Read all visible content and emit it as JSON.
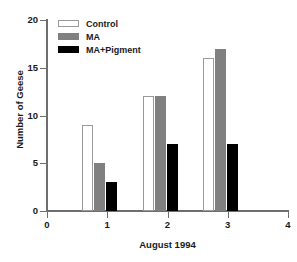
{
  "chart_data": {
    "type": "bar",
    "title": "",
    "xlabel": "August 1994",
    "ylabel": "Number of Geese",
    "categories": [
      "1",
      "2",
      "3"
    ],
    "series": [
      {
        "name": "Control",
        "color": "#ffffff",
        "values": [
          9,
          12,
          16
        ]
      },
      {
        "name": "MA",
        "color": "#808080",
        "values": [
          5,
          12,
          17
        ]
      },
      {
        "name": "MA+Pigment",
        "color": "#000000",
        "values": [
          3,
          7,
          7
        ]
      }
    ],
    "xlim": [
      0,
      4
    ],
    "ylim": [
      0,
      20
    ],
    "xticks": [
      "0",
      "1",
      "2",
      "3",
      "4"
    ],
    "yticks": [
      "0",
      "5",
      "10",
      "15",
      "20"
    ],
    "grid": false,
    "legend_position": "top-left"
  },
  "axes": {
    "y_title": "Number of Geese",
    "x_title": "August 1994",
    "y_ticks": [
      {
        "label": "20",
        "value": 20
      },
      {
        "label": "15",
        "value": 15
      },
      {
        "label": "10",
        "value": 10
      },
      {
        "label": "5",
        "value": 5
      },
      {
        "label": "0",
        "value": 0
      }
    ],
    "x_ticks": [
      {
        "label": "0",
        "value": 0
      },
      {
        "label": "1",
        "value": 1
      },
      {
        "label": "2",
        "value": 2
      },
      {
        "label": "3",
        "value": 3
      },
      {
        "label": "4",
        "value": 4
      }
    ]
  },
  "legend": {
    "items": [
      {
        "label": "Control",
        "swatch": "control"
      },
      {
        "label": "MA",
        "swatch": "ma"
      },
      {
        "label": "MA+Pigment",
        "swatch": "pigment"
      }
    ]
  }
}
